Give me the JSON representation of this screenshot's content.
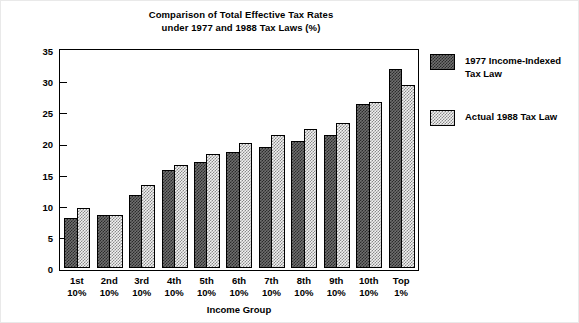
{
  "chart_data": {
    "type": "bar",
    "title": "Comparison of Total Effective Tax Rates under 1977 and 1988 Tax Laws (%)",
    "title_line1": "Comparison of Total Effective Tax Rates",
    "title_line2": "under 1977 and 1988 Tax Laws (%)",
    "xlabel": "Income Group",
    "ylabel": "",
    "ylim": [
      0,
      35
    ],
    "ytick_step": 5,
    "yticks": [
      0,
      5,
      10,
      15,
      20,
      25,
      30,
      35
    ],
    "ytick_labels": [
      "0",
      "5",
      "10",
      "15",
      "20",
      "25",
      "30",
      "35"
    ],
    "grid": false,
    "legend_position": "right",
    "categories": [
      "1st\n10%",
      "2nd\n10%",
      "3rd\n10%",
      "4th\n10%",
      "5th\n10%",
      "6th\n10%",
      "7th\n10%",
      "8th\n10%",
      "9th\n10%",
      "10th\n10%",
      "Top\n1%"
    ],
    "series": [
      {
        "name": "1977 Income-Indexed Tax Law",
        "name_line1": "1977 Income-Indexed",
        "name_line2": "Tax Law",
        "pattern": "dense-checker",
        "color": "#2b2b2b",
        "values": [
          8.1,
          8.6,
          11.8,
          15.8,
          17.0,
          18.6,
          19.5,
          20.4,
          21.4,
          26.3,
          31.9
        ]
      },
      {
        "name": "Actual 1988 Tax Law",
        "name_line1": "Actual 1988 Tax Law",
        "name_line2": "",
        "pattern": "sparse-checker",
        "color": "#8a8a8a",
        "values": [
          9.6,
          8.5,
          13.4,
          16.5,
          18.3,
          20.0,
          21.3,
          22.3,
          23.2,
          26.7,
          29.3
        ]
      }
    ]
  },
  "figure": {
    "background": "#ffffff",
    "axis_color": "#000000"
  }
}
